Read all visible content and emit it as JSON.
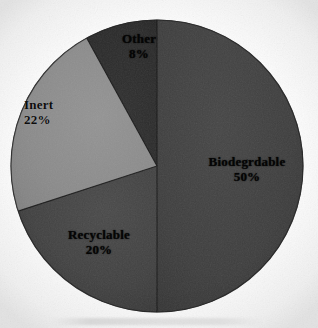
{
  "chart_data": {
    "type": "pie",
    "title": "",
    "subtitle": "",
    "xlabel": "",
    "ylabel": "",
    "legend_position": "none",
    "grid": false,
    "labels_inside": true,
    "start_angle_deg": 0,
    "direction": "clockwise",
    "categories": [
      "Biodegrdable",
      "Recyclable",
      "Inert",
      "Other"
    ],
    "values": [
      50,
      20,
      22,
      8
    ],
    "value_suffix": "%",
    "total": 100,
    "slices": [
      {
        "name": "Biodegrdable",
        "value": 50,
        "value_text": "50%",
        "color": "#3f3f3f",
        "start_deg": 0,
        "end_deg": 180,
        "label_color": "label-dark"
      },
      {
        "name": "Recyclable",
        "value": 20,
        "value_text": "20%",
        "color": "#434343",
        "start_deg": 180,
        "end_deg": 252,
        "label_color": "label-dark"
      },
      {
        "name": "Inert",
        "value": 22,
        "value_text": "22%",
        "color": "#8d8d8d",
        "start_deg": 252,
        "end_deg": 331.2,
        "label_color": "label-light"
      },
      {
        "name": "Other",
        "value": 8,
        "value_text": "8%",
        "color": "#2b2b2b",
        "start_deg": 331.2,
        "end_deg": 360,
        "label_color": "label-dark"
      }
    ],
    "geometry": {
      "center_x": 157,
      "center_y": 166,
      "radius": 146,
      "edge_color": "#111111",
      "background": "#fdfdfd"
    }
  },
  "labels": {
    "biodegradable": {
      "name": "Biodegrdable",
      "value": "50%"
    },
    "recyclable": {
      "name": "Recyclable",
      "value": "20%"
    },
    "inert": {
      "name": "Inert",
      "value": "22%"
    },
    "other": {
      "name": "Other",
      "value": "8%"
    }
  },
  "colors": {
    "biodegradable": "#3f3f3f",
    "recyclable": "#434343",
    "inert": "#8d8d8d",
    "other": "#2b2b2b",
    "background": "#fdfdfd",
    "text": "#0d0d0d"
  }
}
